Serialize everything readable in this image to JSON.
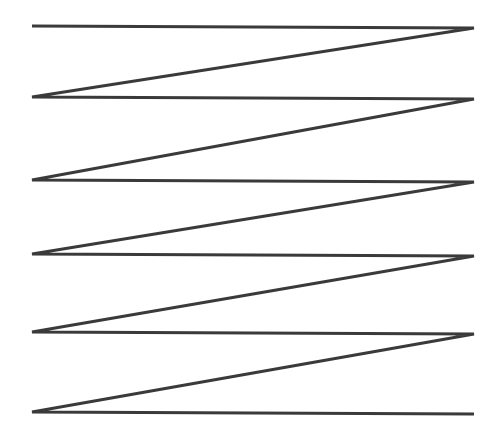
{
  "figure": {
    "title": "Continuous zigzag serpentine line figure",
    "canvas": {
      "width": 499,
      "height": 445,
      "background_color": "#ffffff"
    },
    "stroke": {
      "color": "#3a3a3a",
      "width": 2.8,
      "linecap": "butt",
      "linejoin": "miter"
    },
    "geometry": {
      "left_x": 32,
      "right_x": 474,
      "horizontal_count": 6,
      "diagonal_count": 5,
      "crossing_x": 250,
      "vertex_rows_y": [
        26,
        98,
        181,
        255,
        333,
        413
      ],
      "path_points": [
        {
          "x": 32,
          "y": 26,
          "name": "vertex-1-left"
        },
        {
          "x": 474,
          "y": 28,
          "name": "vertex-1-right"
        },
        {
          "x": 32,
          "y": 97,
          "name": "vertex-2-left"
        },
        {
          "x": 474,
          "y": 99,
          "name": "vertex-2-right"
        },
        {
          "x": 32,
          "y": 180,
          "name": "vertex-3-left"
        },
        {
          "x": 474,
          "y": 182,
          "name": "vertex-3-right"
        },
        {
          "x": 32,
          "y": 254,
          "name": "vertex-4-left"
        },
        {
          "x": 474,
          "y": 256,
          "name": "vertex-4-right"
        },
        {
          "x": 32,
          "y": 332,
          "name": "vertex-5-left"
        },
        {
          "x": 474,
          "y": 334,
          "name": "vertex-5-right"
        },
        {
          "x": 32,
          "y": 412,
          "name": "vertex-6-left"
        },
        {
          "x": 474,
          "y": 414,
          "name": "vertex-6-right"
        }
      ],
      "path_d": "M 32 26 L 474 28 L 32 97 L 474 99 L 32 180 L 474 182 L 32 254 L 474 256 L 32 332 L 474 334 L 32 412 L 474 414",
      "crossing_points": [
        {
          "x": 250,
          "y": 63
        },
        {
          "x": 250,
          "y": 142
        },
        {
          "x": 250,
          "y": 220
        },
        {
          "x": 250,
          "y": 296
        },
        {
          "x": 250,
          "y": 376
        }
      ]
    }
  }
}
